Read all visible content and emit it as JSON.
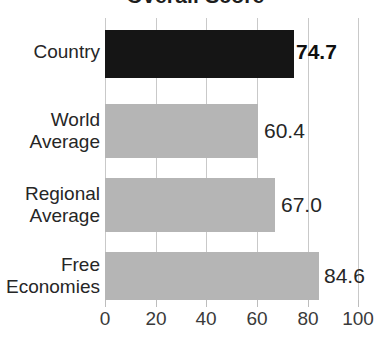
{
  "title": {
    "text": "Overall Score",
    "clipped": true
  },
  "chart_data": {
    "type": "bar",
    "orientation": "horizontal",
    "title": "",
    "xlabel": "",
    "ylabel": "",
    "categories": [
      "Country",
      "World\nAverage",
      "Regional\nAverage",
      "Free\nEconomies"
    ],
    "values": [
      74.7,
      60.4,
      67.0,
      84.6
    ],
    "value_labels": [
      "74.7",
      "60.4",
      "67.0",
      "84.6"
    ],
    "xlim": [
      0,
      100
    ],
    "xticks": [
      0,
      20,
      40,
      60,
      80,
      100
    ],
    "xtick_labels": [
      "0",
      "20",
      "40",
      "60",
      "80",
      "100"
    ],
    "grid": true,
    "grid_axis": "x",
    "legend": false,
    "bar_colors": [
      "#151515",
      "#b5b5b5",
      "#b5b5b5",
      "#b5b5b5"
    ],
    "highlight_index": 0,
    "colors": {
      "highlight_bar": "#151515",
      "default_bar": "#b5b5b5",
      "gridline": "#c9c9c9",
      "text": "#262626",
      "background": "#ffffff"
    }
  },
  "axis": {
    "ticks": [
      {
        "label": "0",
        "x": 105
      },
      {
        "label": "20",
        "x": 156
      },
      {
        "label": "40",
        "x": 206
      },
      {
        "label": "60",
        "x": 257
      },
      {
        "label": "80",
        "x": 308
      },
      {
        "label": "100",
        "x": 358
      }
    ]
  },
  "rows": [
    {
      "label": "Country",
      "value": "74.7",
      "bar_top": 30,
      "bar_height": 48,
      "bar_width": 189,
      "label_top": 41,
      "value_left": 296,
      "value_top": 40,
      "emphasis": true,
      "color": "dark"
    },
    {
      "label": "World\nAverage",
      "value": "60.4",
      "bar_top": 104,
      "bar_height": 54,
      "bar_width": 153,
      "label_top": 109,
      "value_left": 264,
      "value_top": 119,
      "emphasis": false,
      "color": "gray"
    },
    {
      "label": "Regional\nAverage",
      "value": "67.0",
      "bar_top": 178,
      "bar_height": 54,
      "bar_width": 170,
      "label_top": 183,
      "value_left": 281,
      "value_top": 193,
      "emphasis": false,
      "color": "gray"
    },
    {
      "label": "Free\nEconomies",
      "value": "84.6",
      "bar_top": 252,
      "bar_height": 48,
      "bar_width": 214,
      "label_top": 254,
      "value_left": 324,
      "value_top": 264,
      "emphasis": false,
      "color": "gray"
    }
  ]
}
